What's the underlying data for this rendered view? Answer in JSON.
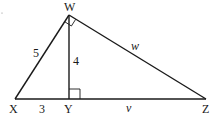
{
  "diagram": {
    "type": "right-triangle-with-altitude",
    "vertices": {
      "W": {
        "label": "W",
        "x": 69,
        "y": 15
      },
      "X": {
        "label": "X",
        "x": 15,
        "y": 99
      },
      "Y": {
        "label": "Y",
        "x": 69,
        "y": 99
      },
      "Z": {
        "label": "Z",
        "x": 206,
        "y": 99
      }
    },
    "segments": [
      {
        "from": "W",
        "to": "X",
        "label": "5"
      },
      {
        "from": "W",
        "to": "Y",
        "label": "4"
      },
      {
        "from": "W",
        "to": "Z",
        "label": "w"
      },
      {
        "from": "X",
        "to": "Y",
        "label": "3"
      },
      {
        "from": "Y",
        "to": "Z",
        "label": "v"
      }
    ],
    "right_angles": [
      "W",
      "Y"
    ],
    "labels": {
      "W": "W",
      "X": "X",
      "Y": "Y",
      "Z": "Z",
      "WX": "5",
      "WY": "4",
      "WZ": "w",
      "XY": "3",
      "YZ": "v"
    },
    "color": "#1a1a1a"
  }
}
